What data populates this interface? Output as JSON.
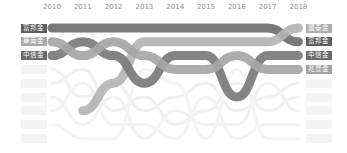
{
  "chart_data": {
    "type": "bump",
    "title": "",
    "xlabel": "",
    "ylabel": "",
    "x": [
      "2010",
      "2011",
      "2012",
      "2013",
      "2014",
      "2015",
      "2016",
      "2017",
      "2018"
    ],
    "rank_range": [
      1,
      9
    ],
    "legend_position": "labels at both ends",
    "grid": false,
    "series": [
      {
        "name": "富邦金",
        "color": "#6e6e6e",
        "ranks": [
          1,
          1,
          1,
          1,
          1,
          1,
          1,
          1,
          2
        ]
      },
      {
        "name": "國泰金",
        "color": "#b4b4b4",
        "ranks": [
          null,
          7,
          5,
          2,
          2,
          2,
          2,
          2,
          1
        ]
      },
      {
        "name": "中信金",
        "color": "#7a7a7a",
        "ranks": [
          3,
          2,
          3,
          5,
          3,
          3,
          6,
          3,
          3
        ]
      },
      {
        "name": "兆豐金",
        "color": "#a6a6a6",
        "ranks": [
          2,
          3,
          2,
          3,
          4,
          4,
          3,
          4,
          4
        ]
      },
      {
        "name": "background-1",
        "color": "#f0f0f0",
        "ranks": [
          4,
          6,
          5,
          7,
          6,
          5,
          7,
          6,
          5
        ]
      },
      {
        "name": "background-2",
        "color": "#f0f0f0",
        "ranks": [
          5,
          4,
          7,
          6,
          8,
          7,
          5,
          7,
          6
        ]
      },
      {
        "name": "background-3",
        "color": "#f2f2f2",
        "ranks": [
          6,
          8,
          6,
          9,
          7,
          8,
          8,
          5,
          7
        ]
      },
      {
        "name": "background-4",
        "color": "#f3f3f3",
        "ranks": [
          7,
          5,
          8,
          8,
          9,
          6,
          9,
          8,
          8
        ]
      },
      {
        "name": "background-5",
        "color": "#f4f4f4",
        "ranks": [
          8,
          9,
          9,
          4,
          5,
          9,
          4,
          9,
          9
        ]
      }
    ]
  },
  "labels": {
    "left": [
      {
        "text": "富邦金",
        "bg": "#5e5e5e"
      },
      {
        "text": "華南金",
        "bg": "#a8a8a8"
      },
      {
        "text": "中信金",
        "bg": "#6a6a6a"
      }
    ],
    "right": [
      {
        "text": "國泰金",
        "bg": "#ababab"
      },
      {
        "text": "富邦金",
        "bg": "#5e5e5e"
      },
      {
        "text": "中信金",
        "bg": "#6a6a6a"
      },
      {
        "text": "兆豐金",
        "bg": "#a3a3a3"
      }
    ]
  }
}
